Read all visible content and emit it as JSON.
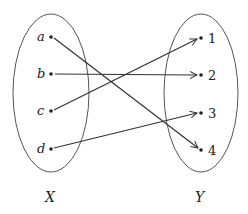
{
  "domain_set": {
    "name": "X",
    "elements": [
      "a",
      "b",
      "c",
      "d"
    ]
  },
  "codomain_set": {
    "name": "Y",
    "elements": [
      "1",
      "2",
      "3",
      "4"
    ]
  },
  "mapping": [
    {
      "from": "a",
      "to": "4"
    },
    {
      "from": "b",
      "to": "2"
    },
    {
      "from": "c",
      "to": "1"
    },
    {
      "from": "d",
      "to": "3"
    }
  ],
  "colors": {
    "stroke": "#333333",
    "ellipse": "#555555",
    "text": "#222222"
  }
}
